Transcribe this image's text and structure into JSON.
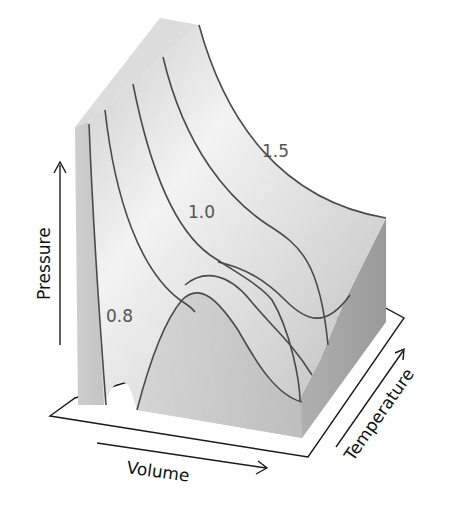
{
  "diagram": {
    "type": "3d-surface",
    "axes": {
      "x_label": "Volume",
      "y_label": "Pressure",
      "z_label": "Temperature"
    },
    "contour_labels": [
      "0.8",
      "1.0",
      "1.5"
    ],
    "contour_count": 5,
    "colors": {
      "surface_light": "#f2f2f2",
      "surface_dark": "#a8a8a8",
      "contour": "#4a4a4a",
      "axis": "#1a1a1a",
      "label": "#555555"
    }
  }
}
